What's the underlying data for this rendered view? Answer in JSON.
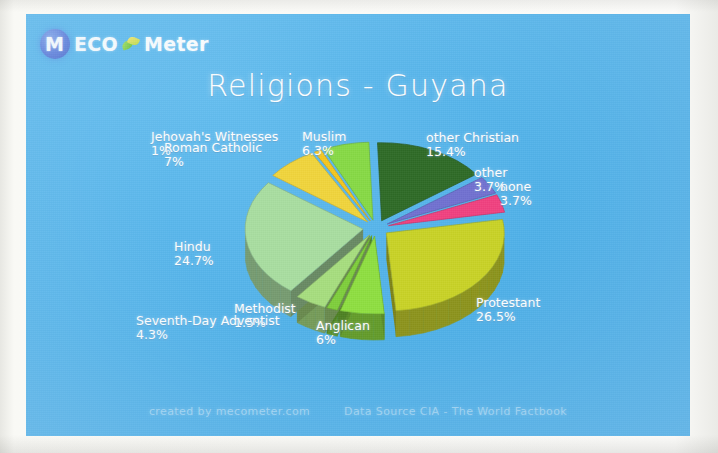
{
  "brand": {
    "logo_letter": "M",
    "word_eco": "ECO",
    "word_meter": "Meter",
    "globe_icon": "globe-icon",
    "leaf_icon": "leaf-icon"
  },
  "title": "Religions - Guyana",
  "footer": {
    "created_by": "created by mecometer.com",
    "data_source": "Data Source CIA - The World Factbook"
  },
  "colors": {
    "background": "#4fb0e8",
    "text": "#ffffff"
  },
  "chart_data": {
    "type": "pie",
    "title": "Religions - Guyana",
    "subtitle": "",
    "xlabel": "",
    "ylabel": "",
    "legend_position": "none",
    "exploded": true,
    "three_d": true,
    "value_unit": "%",
    "labels": [
      "other Christian",
      "other",
      "none",
      "Protestant",
      "Anglican",
      "Methodist",
      "Seventh-Day Adventist",
      "Hindu",
      "Roman Catholic",
      "Jehovah's Witnesses",
      "Muslim"
    ],
    "values": [
      15.4,
      3.7,
      3.7,
      26.5,
      6,
      1.5,
      4.3,
      24.7,
      7,
      1,
      6.3
    ],
    "value_labels": [
      "15.4%",
      "3.7%",
      "3.7%",
      "26.5%",
      "6%",
      "1.5%",
      "4.3%",
      "24.7%",
      "7%",
      "1%",
      "6.3%"
    ],
    "slice_colors": [
      "#2f6b28",
      "#6f6fd0",
      "#f0407f",
      "#c8d227",
      "#8ede3f",
      "#7ece3a",
      "#a6dd7e",
      "#a8dda0",
      "#f0d43a",
      "#f5c61f",
      "#86d944"
    ],
    "slices": [
      {
        "label": "other Christian",
        "value": 15.4,
        "value_label": "15.4%",
        "color": "#2f6b28"
      },
      {
        "label": "other",
        "value": 3.7,
        "value_label": "3.7%",
        "color": "#6f6fd0"
      },
      {
        "label": "none",
        "value": 3.7,
        "value_label": "3.7%",
        "color": "#f0407f"
      },
      {
        "label": "Protestant",
        "value": 26.5,
        "value_label": "26.5%",
        "color": "#c8d227"
      },
      {
        "label": "Anglican",
        "value": 6,
        "value_label": "6%",
        "color": "#8ede3f"
      },
      {
        "label": "Methodist",
        "value": 1.5,
        "value_label": "1.5%",
        "color": "#7ece3a"
      },
      {
        "label": "Seventh-Day Adventist",
        "value": 4.3,
        "value_label": "4.3%",
        "color": "#a6dd7e"
      },
      {
        "label": "Hindu",
        "value": 24.7,
        "value_label": "24.7%",
        "color": "#a8dda0"
      },
      {
        "label": "Roman Catholic",
        "value": 7,
        "value_label": "7%",
        "color": "#f0d43a"
      },
      {
        "label": "Jehovah's Witnesses",
        "value": 1,
        "value_label": "1%",
        "color": "#f5c61f"
      },
      {
        "label": "Muslim",
        "value": 6.3,
        "value_label": "6.3%",
        "color": "#86d944"
      }
    ]
  }
}
